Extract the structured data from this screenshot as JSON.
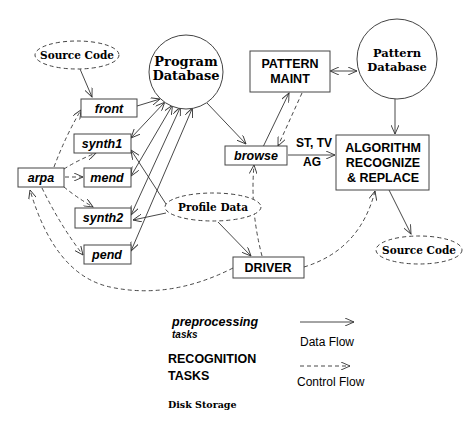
{
  "nodes": {
    "source_code_top": {
      "label": "Source Code",
      "type": "disk-storage"
    },
    "program_database": {
      "label_line1": "Program",
      "label_line2": "Database",
      "type": "database"
    },
    "front": {
      "label": "front",
      "type": "preprocessing-task"
    },
    "synth1": {
      "label": "synth1",
      "type": "preprocessing-task"
    },
    "mend": {
      "label": "mend",
      "type": "preprocessing-task"
    },
    "arpa": {
      "label": "arpa",
      "type": "preprocessing-task"
    },
    "synth2": {
      "label": "synth2",
      "type": "preprocessing-task"
    },
    "pend": {
      "label": "pend",
      "type": "preprocessing-task"
    },
    "profile_data": {
      "label": "Profile Data",
      "type": "disk-storage"
    },
    "browse": {
      "label": "browse",
      "type": "preprocessing-task"
    },
    "pattern_maint": {
      "label_line1": "PATTERN",
      "label_line2": "MAINT",
      "type": "recognition-task"
    },
    "pattern_database": {
      "label_line1": "Pattern",
      "label_line2": "Database",
      "type": "database"
    },
    "algorithm": {
      "label_line1": "ALGORITHM",
      "label_line2": "RECOGNIZE",
      "label_line3": "& REPLACE",
      "type": "recognition-task"
    },
    "driver": {
      "label": "DRIVER",
      "type": "recognition-task"
    },
    "source_code_right": {
      "label": "Source Code",
      "type": "disk-storage"
    }
  },
  "edge_labels": {
    "st_tv": "ST, TV",
    "ag": "AG"
  },
  "edges": [
    {
      "from": "source_code_top",
      "to": "front",
      "kind": "data"
    },
    {
      "from": "front",
      "to": "program_database",
      "kind": "data"
    },
    {
      "from": "program_database",
      "to": "synth1",
      "kind": "data"
    },
    {
      "from": "program_database",
      "to": "mend",
      "kind": "data"
    },
    {
      "from": "program_database",
      "to": "synth2",
      "kind": "data"
    },
    {
      "from": "program_database",
      "to": "pend",
      "kind": "data"
    },
    {
      "from": "synth1",
      "to": "program_database",
      "kind": "data"
    },
    {
      "from": "mend",
      "to": "program_database",
      "kind": "data"
    },
    {
      "from": "synth2",
      "to": "program_database",
      "kind": "data"
    },
    {
      "from": "pend",
      "to": "program_database",
      "kind": "data"
    },
    {
      "from": "profile_data",
      "to": "synth1",
      "kind": "data"
    },
    {
      "from": "profile_data",
      "to": "synth2",
      "kind": "data"
    },
    {
      "from": "profile_data",
      "to": "driver",
      "kind": "data"
    },
    {
      "from": "program_database",
      "to": "browse",
      "kind": "data"
    },
    {
      "from": "browse",
      "to": "pattern_maint",
      "kind": "data"
    },
    {
      "from": "pattern_maint",
      "to": "browse",
      "kind": "control"
    },
    {
      "from": "pattern_maint",
      "to": "pattern_database",
      "kind": "data"
    },
    {
      "from": "pattern_database",
      "to": "pattern_maint",
      "kind": "data"
    },
    {
      "from": "pattern_database",
      "to": "algorithm",
      "kind": "data"
    },
    {
      "from": "browse",
      "to": "algorithm",
      "kind": "data"
    },
    {
      "from": "algorithm",
      "to": "source_code_right",
      "kind": "data"
    },
    {
      "from": "arpa",
      "to": "front",
      "kind": "control"
    },
    {
      "from": "arpa",
      "to": "synth1",
      "kind": "control"
    },
    {
      "from": "arpa",
      "to": "mend",
      "kind": "control"
    },
    {
      "from": "arpa",
      "to": "synth2",
      "kind": "control"
    },
    {
      "from": "arpa",
      "to": "pend",
      "kind": "control"
    },
    {
      "from": "driver",
      "to": "arpa",
      "kind": "control"
    },
    {
      "from": "driver",
      "to": "browse",
      "kind": "control"
    },
    {
      "from": "driver",
      "to": "algorithm",
      "kind": "control"
    }
  ],
  "legend": {
    "preprocessing_line1": "preprocessing",
    "preprocessing_line2": "tasks",
    "recognition_line1": "RECOGNITION",
    "recognition_line2": "TASKS",
    "disk_storage": "Disk Storage",
    "data_flow": "Data Flow",
    "control_flow": "Control Flow"
  }
}
